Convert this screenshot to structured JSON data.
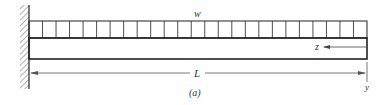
{
  "figure": {
    "caption": "(a)",
    "load_label": "w",
    "length_label": "L",
    "axis_z_label": "z",
    "axis_y_label": "y"
  },
  "colors": {
    "stroke": "#222222",
    "dimension": "#555555",
    "hatch": "#666666"
  },
  "geometry": {
    "wall_x": 29,
    "beam_left": 29,
    "beam_right": 367,
    "load_top": 21,
    "beam_top": 38,
    "beam_bottom": 59,
    "load_divisions": 25,
    "dimension_y": 73
  }
}
